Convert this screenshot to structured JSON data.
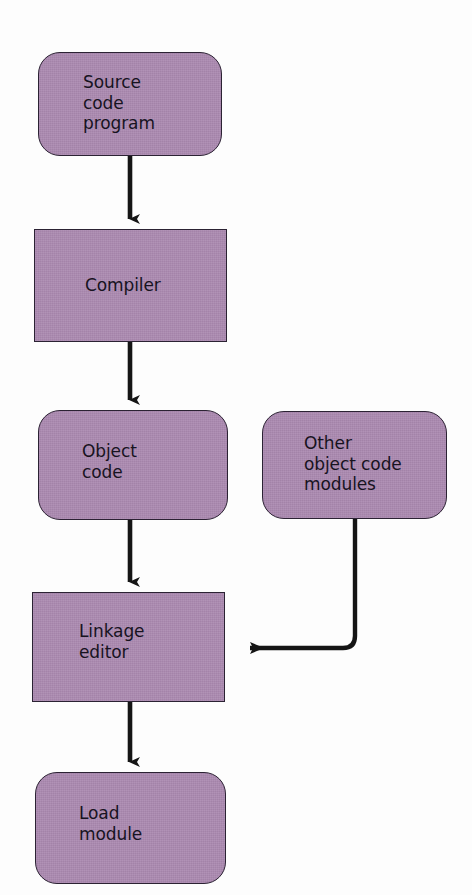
{
  "diagram": {
    "type": "flowchart",
    "colors": {
      "node_fill": "#ab89b0",
      "node_border": "#2b2233",
      "text": "#17131f",
      "connector": "#151515",
      "background": "#fdfdfd"
    },
    "nodes": [
      {
        "id": "source-code-program",
        "label": "Source\ncode\nprogram",
        "shape": "rounded-rectangle",
        "x": 38,
        "y": 52,
        "width": 184,
        "height": 104,
        "text_x": 83,
        "text_y": 72
      },
      {
        "id": "compiler",
        "label": "Compiler",
        "shape": "rectangle",
        "x": 34,
        "y": 229,
        "width": 193,
        "height": 113,
        "text_x": 85,
        "text_y": 275
      },
      {
        "id": "object-code",
        "label": "Object\ncode",
        "shape": "rounded-rectangle",
        "x": 38,
        "y": 410,
        "width": 190,
        "height": 110,
        "text_x": 82,
        "text_y": 441
      },
      {
        "id": "other-object-code-modules",
        "label": "Other\nobject code\nmodules",
        "shape": "rounded-rectangle",
        "x": 262,
        "y": 411,
        "width": 185,
        "height": 108,
        "text_x": 304,
        "text_y": 433
      },
      {
        "id": "linkage-editor",
        "label": "Linkage\neditor",
        "shape": "rectangle",
        "x": 32,
        "y": 592,
        "width": 193,
        "height": 110,
        "text_x": 79,
        "text_y": 621
      },
      {
        "id": "load-module",
        "label": "Load\nmodule",
        "shape": "rounded-rectangle",
        "x": 35,
        "y": 772,
        "width": 191,
        "height": 112,
        "text_x": 79,
        "text_y": 803
      }
    ],
    "connectors": [
      {
        "id": "source-to-compiler",
        "from": "source-code-program",
        "to": "compiler",
        "kind": "straight-down-arrow",
        "path": "M130,156 L130,219",
        "arrow_tip_x": 130,
        "arrow_tip_y": 229
      },
      {
        "id": "compiler-to-object-code",
        "from": "compiler",
        "to": "object-code",
        "kind": "straight-down-arrow",
        "path": "M130,342 L130,400",
        "arrow_tip_x": 130,
        "arrow_tip_y": 410
      },
      {
        "id": "object-code-to-linkage-editor",
        "from": "object-code",
        "to": "linkage-editor",
        "kind": "straight-down-arrow",
        "path": "M130,520 L130,582",
        "arrow_tip_x": 130,
        "arrow_tip_y": 592
      },
      {
        "id": "other-modules-to-linkage-editor",
        "from": "other-object-code-modules",
        "to": "linkage-editor",
        "kind": "elbow-left-arrow",
        "path": "M355,519 L355,638 Q355,648 345,648 L248,648",
        "arrow_tip_x": 234,
        "arrow_tip_y": 648
      },
      {
        "id": "linkage-editor-to-load-module",
        "from": "linkage-editor",
        "to": "load-module",
        "kind": "straight-down-arrow",
        "path": "M130,702 L130,762",
        "arrow_tip_x": 130,
        "arrow_tip_y": 772
      }
    ]
  }
}
